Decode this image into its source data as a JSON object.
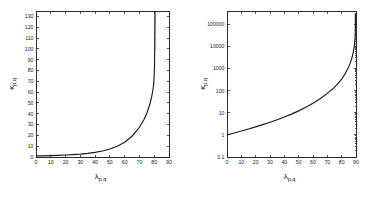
{
  "figure": {
    "background": "#ffffff",
    "curve_color": "#1a1a1a",
    "axis_color": "#2b2b2b"
  },
  "chart_data": [
    {
      "type": "line",
      "panel": "left",
      "title": "",
      "xlabel": "λ",
      "xlabel_sub": "p,q",
      "ylabel": "κ",
      "ylabel_sub": "p,q",
      "xscale": "linear",
      "yscale": "linear",
      "xlim": [
        0,
        90
      ],
      "ylim": [
        0,
        135
      ],
      "xticks": [
        0,
        10,
        20,
        30,
        40,
        50,
        60,
        70,
        80,
        90
      ],
      "xticklabels": [
        "0",
        "10",
        "20",
        "30",
        "40",
        "50",
        "60",
        "70",
        "80",
        "90"
      ],
      "yticks": [
        0,
        10,
        20,
        30,
        40,
        50,
        60,
        70,
        80,
        90,
        100,
        110,
        120,
        130
      ],
      "yticklabels": [
        "0",
        "10",
        "20",
        "30",
        "40",
        "50",
        "60",
        "70",
        "80",
        "90",
        "100",
        "110",
        "120",
        "130"
      ],
      "grid": false,
      "legend": false,
      "annotations": [
        {
          "name": "vertical-asymptote",
          "x": 80.5,
          "style": "dotted",
          "y_from": 100,
          "y_to": 135
        }
      ],
      "series": [
        {
          "name": "kappa_pq",
          "x": [
            0,
            5,
            10,
            15,
            20,
            25,
            30,
            35,
            40,
            45,
            50,
            55,
            60,
            65,
            70,
            73,
            75,
            77,
            78,
            79,
            79.6,
            80,
            80.2,
            80.35,
            80.45,
            80.5
          ],
          "values": [
            1.0,
            1.1,
            1.3,
            1.5,
            1.8,
            2.2,
            2.7,
            3.4,
            4.3,
            5.6,
            7.4,
            10.0,
            13.7,
            19.2,
            27.5,
            34.5,
            40.5,
            48.5,
            54.0,
            61.0,
            67.0,
            76.0,
            86.0,
            100.0,
            118.0,
            135.0
          ]
        }
      ]
    },
    {
      "type": "line",
      "panel": "right",
      "title": "",
      "xlabel": "λ",
      "xlabel_sub": "p,q",
      "ylabel": "κ",
      "ylabel_sub": "p,q",
      "xscale": "linear",
      "yscale": "log",
      "xlim": [
        0,
        90
      ],
      "ylim": [
        0.1,
        400000
      ],
      "xticks": [
        0,
        10,
        20,
        30,
        40,
        50,
        60,
        70,
        80,
        90
      ],
      "xticklabels": [
        "0",
        "10",
        "20",
        "30",
        "40",
        "50",
        "60",
        "70",
        "80",
        "90"
      ],
      "yticks": [
        0.1,
        1,
        10,
        100,
        1000,
        10000,
        100000
      ],
      "yticklabels": [
        "0.1",
        "1",
        "10",
        "100",
        "1000",
        "10000",
        "100000"
      ],
      "grid": false,
      "legend": false,
      "annotations": [
        {
          "name": "vertical-asymptote",
          "x": 89.6,
          "style": "dotted",
          "y_from": 10000,
          "y_to": 400000
        }
      ],
      "series": [
        {
          "name": "kappa_pq",
          "x": [
            0,
            5,
            10,
            15,
            20,
            25,
            30,
            35,
            40,
            45,
            50,
            55,
            60,
            65,
            70,
            75,
            78,
            80,
            82,
            84,
            85,
            86,
            87,
            88,
            88.6,
            89,
            89.3,
            89.5,
            89.6
          ],
          "values": [
            1.0,
            1.22,
            1.5,
            1.85,
            2.3,
            2.9,
            3.7,
            4.8,
            6.4,
            8.7,
            12.2,
            17.8,
            27.0,
            43.0,
            75.0,
            140.0,
            230.0,
            330.0,
            520.0,
            900.0,
            1250.0,
            1800.0,
            2800.0,
            5000.0,
            8000.0,
            13000.0,
            22000.0,
            45000.0,
            300000.0
          ]
        }
      ]
    }
  ]
}
